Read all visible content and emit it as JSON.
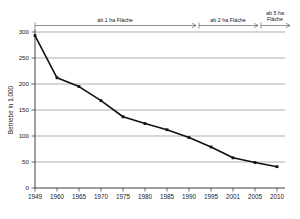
{
  "chart_data": {
    "type": "line",
    "title": "",
    "subtitle": "",
    "xlabel": "",
    "ylabel": "Betriebe in 1.000",
    "categories": [
      "1949",
      "1960",
      "1965",
      "1970",
      "1975",
      "1980",
      "1985",
      "1990",
      "1995",
      "2001",
      "2005",
      "2010"
    ],
    "values": [
      293,
      212,
      195,
      168,
      137,
      124,
      112,
      97,
      79,
      58,
      49,
      41
    ],
    "series": [
      {
        "name": "Betriebe in 1.000",
        "values": [
          293,
          212,
          195,
          168,
          137,
          124,
          112,
          97,
          79,
          58,
          49,
          41
        ]
      }
    ],
    "ylim": [
      0,
      300
    ],
    "yticks": [
      "0",
      "50",
      "100",
      "150",
      "200",
      "250",
      "300"
    ],
    "ytick_values": [
      0,
      50,
      100,
      150,
      200,
      250,
      300
    ],
    "grid": true,
    "legend": "none",
    "marker": "square",
    "line_color": "#111111",
    "grid_color": "#8c8c8c",
    "annotations": [
      {
        "label": "ab 1 ha Fläche",
        "start_category": "1949",
        "end_category": "1995"
      },
      {
        "label": "ab 2 ha Fläche",
        "start_category": "1995",
        "end_category": "2005"
      },
      {
        "label": "ab 5 ha Fläche",
        "start_category": "2005",
        "end_category": "2010"
      }
    ]
  },
  "axis": {
    "y_title": "Betriebe in 1.000"
  },
  "bands": {
    "band1_label": "ab 1 ha Fläche",
    "band2_label": "ab 2 ha Fläche",
    "band3_label_line1": "ab 5 ha",
    "band3_label_line2": "Fläche"
  },
  "yticks": {
    "t0": "0",
    "t1": "50",
    "t2": "100",
    "t3": "150",
    "t4": "200",
    "t5": "250",
    "t6": "300"
  },
  "xticks": {
    "t0": "1949",
    "t1": "1960",
    "t2": "1965",
    "t3": "1970",
    "t4": "1975",
    "t5": "1980",
    "t6": "1985",
    "t7": "1990",
    "t8": "1995",
    "t9": "2001",
    "t10": "2005",
    "t11": "2010"
  }
}
